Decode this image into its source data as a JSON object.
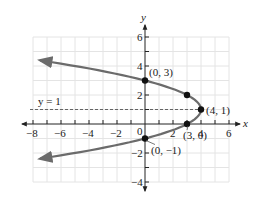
{
  "chart_data": {
    "type": "line",
    "title": "",
    "xlabel": "x",
    "ylabel": "y",
    "xlim": [
      -8,
      7
    ],
    "ylim": [
      -4,
      6
    ],
    "grid": true,
    "x_ticks": [
      -8,
      -7,
      -6,
      -5,
      -4,
      -3,
      -2,
      -1,
      1,
      2,
      3,
      4,
      5,
      6
    ],
    "x_tick_labels": [
      "-8",
      "-6",
      "-4",
      "-2",
      "0",
      "2",
      "4",
      "6"
    ],
    "y_ticks": [
      -4,
      -3,
      -2,
      -1,
      1,
      2,
      3,
      4,
      5,
      6
    ],
    "y_tick_labels": [
      "-4",
      "-2",
      "2",
      "4",
      "6"
    ],
    "curve": {
      "name": "parabola x = -(y-1)^2 + 4",
      "color": "#6b6b6b",
      "vertex": [
        4,
        1
      ],
      "opens": "left",
      "y_range": [
        -2.39,
        4.39
      ],
      "arrows": "both ends"
    },
    "axis_of_symmetry": {
      "label": "y = 1",
      "y": 1,
      "style": "dashed"
    },
    "points": [
      {
        "x": 0,
        "y": 3,
        "label": "(0, 3)"
      },
      {
        "x": 3,
        "y": 2,
        "label": ""
      },
      {
        "x": 4,
        "y": 1,
        "label": "(4, 1)"
      },
      {
        "x": 3,
        "y": 0,
        "label": "(3, 0)"
      },
      {
        "x": 0,
        "y": -1,
        "label": "(0, −1)"
      }
    ]
  },
  "labels": {
    "x_axis": "x",
    "y_axis": "y",
    "sym_line": "y = 1",
    "p_0_3": "(0, 3)",
    "p_4_1": "(4, 1)",
    "p_3_0": "(3, 0)",
    "p_0_m1": "(0, −1)",
    "xt_m8": "−8",
    "xt_m6": "−6",
    "xt_m4": "−4",
    "xt_m2": "−2",
    "xt_0": "0",
    "xt_2": "2",
    "xt_4": "4",
    "xt_6": "6",
    "yt_6": "6",
    "yt_4": "4",
    "yt_2": "2",
    "yt_m2": "−2",
    "yt_m4": "−4"
  }
}
